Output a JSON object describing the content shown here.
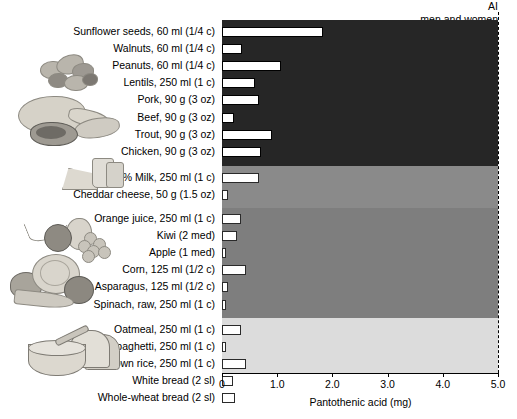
{
  "header": {
    "ai_label_line1": "AI",
    "ai_label_line2": "men and women"
  },
  "axis": {
    "xlabel": "Pantothenic acid (mg)",
    "ticks": [
      "0",
      "1.0",
      "2.0",
      "3.0",
      "4.0",
      "5.0"
    ],
    "xmin": 0,
    "xmax": 5.0,
    "ai_reference_value": 5.0
  },
  "groups": [
    {
      "name": "protein-foods",
      "band_color": "#262626",
      "illustration": "nuts-meat-poultry-fish"
    },
    {
      "name": "dairy-foods",
      "band_color": "#8a8a8a",
      "illustration": "milk-cheese"
    },
    {
      "name": "fruits-vegetables",
      "band_color": "#7e7e7e",
      "illustration": "fruit-vegetable-basket"
    },
    {
      "name": "grain-foods",
      "band_color": "#dcdcdc",
      "illustration": "cereal-bowl-bread"
    }
  ],
  "chart_data": {
    "type": "bar",
    "orientation": "horizontal",
    "title": "",
    "xlabel": "Pantothenic acid (mg)",
    "ylabel": "",
    "xlim": [
      0,
      5.0
    ],
    "grid": false,
    "legend": "none",
    "annotations": [
      {
        "text": "AI men and women",
        "value": 5.0,
        "style": "dashed vertical line at x = 5.0"
      }
    ],
    "categories": [
      "Sunflower seeds, 60 ml (1/4 c)",
      "Walnuts, 60 ml (1/4 c)",
      "Peanuts, 60 ml (1/4 c)",
      "Lentils, 250 ml (1 c)",
      "Pork, 90 g (3 oz)",
      "Beef, 90 g (3 oz)",
      "Trout, 90 g (3 oz)",
      "Chicken, 90 g (3 oz)",
      "2% Milk, 250 ml (1 c)",
      "Cheddar cheese, 50 g (1.5 oz)",
      "Orange juice, 250 ml (1 c)",
      "Kiwi (2 med)",
      "Apple (1 med)",
      "Corn, 125 ml (1/2 c)",
      "Asparagus, 125 ml (1/2 c)",
      "Spinach, raw, 250 ml (1 c)",
      "Oatmeal, 250 ml (1 c)",
      "Spaghetti, 250 ml (1 c)",
      "Brown rice, 250 ml (1 c)",
      "White bread (2 sl)",
      "Whole-wheat bread (2 sl)"
    ],
    "values": [
      1.83,
      0.36,
      1.07,
      0.6,
      0.67,
      0.22,
      0.9,
      0.7,
      0.67,
      0.11,
      0.35,
      0.27,
      0.07,
      0.44,
      0.1,
      0.06,
      0.35,
      0.06,
      0.44,
      0.2,
      0.24
    ],
    "group_of_category": [
      "protein-foods",
      "protein-foods",
      "protein-foods",
      "protein-foods",
      "protein-foods",
      "protein-foods",
      "protein-foods",
      "protein-foods",
      "dairy-foods",
      "dairy-foods",
      "fruits-vegetables",
      "fruits-vegetables",
      "fruits-vegetables",
      "fruits-vegetables",
      "fruits-vegetables",
      "fruits-vegetables",
      "grain-foods",
      "grain-foods",
      "grain-foods",
      "grain-foods",
      "grain-foods"
    ]
  }
}
